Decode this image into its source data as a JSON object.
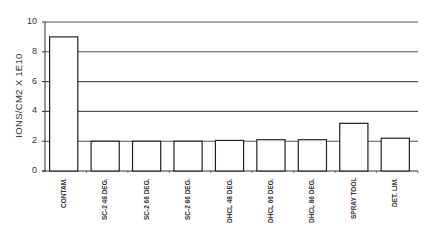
{
  "chart_data": {
    "type": "bar",
    "title": "",
    "xlabel": "",
    "ylabel": "IONS/CM2 X 1E10",
    "ylim": [
      0,
      10
    ],
    "yticks": [
      0,
      2,
      4,
      6,
      8,
      10
    ],
    "grid": "horizontal",
    "legend": "none",
    "categories": [
      "CONTAM.",
      "SC-2 48 DEG.",
      "SC-2 66 DEG.",
      "SC-2 86 DEG.",
      "DHCL 48 DEG.",
      "DHCL 66 DEG.",
      "DHCL 86 DEG.",
      "SPRAY TOOL",
      "DET. LIM."
    ],
    "values": [
      9.0,
      2.0,
      2.0,
      2.0,
      2.05,
      2.1,
      2.1,
      3.2,
      2.2
    ]
  }
}
